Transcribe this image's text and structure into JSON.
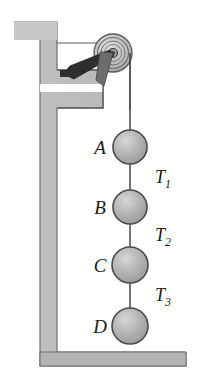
{
  "figure": {
    "background_color": "#ffffff",
    "wall_fill": "#b9b9b9",
    "wall_stroke": "#6e6e6e",
    "mass_fill": "#b0b0b0",
    "mass_stroke": "#4a4a4a",
    "rope_color": "#3a3a3a",
    "pulley_fill": "#c3c3c3",
    "bracket_color": "#2e2e2e",
    "label_color": "#1a1a1a"
  },
  "pulley": {
    "name": "pulley",
    "center_x": 113,
    "center_y": 53,
    "outer_radius": 19,
    "rim_radius": 15,
    "inner_radius": 11,
    "hub_radius": 4,
    "axle_radius": 2
  },
  "bracket": {
    "name": "pulley-bracket",
    "description": "tapered arm mounting pulley to wall ledge"
  },
  "masses": [
    {
      "label": "A",
      "cx": 130,
      "cy": 147,
      "r": 17,
      "label_x": 100,
      "label_y": 154
    },
    {
      "label": "B",
      "cx": 130,
      "cy": 207,
      "r": 17,
      "label_x": 100,
      "label_y": 214
    },
    {
      "label": "C",
      "cx": 130,
      "cy": 265,
      "r": 18,
      "label_x": 100,
      "label_y": 272
    },
    {
      "label": "D",
      "cx": 130,
      "cy": 326,
      "r": 18,
      "label_x": 100,
      "label_y": 333
    }
  ],
  "tensions": [
    {
      "label": "T",
      "subscript": "1",
      "x": 155,
      "y": 183
    },
    {
      "label": "T",
      "subscript": "2",
      "x": 155,
      "y": 241
    },
    {
      "label": "T",
      "subscript": "3",
      "x": 155,
      "y": 301
    }
  ],
  "rope": {
    "name": "rope",
    "top_x": 130,
    "top_y": 53,
    "bottom_y": 308
  },
  "floor": {
    "name": "floor",
    "y": 352,
    "height": 14
  }
}
